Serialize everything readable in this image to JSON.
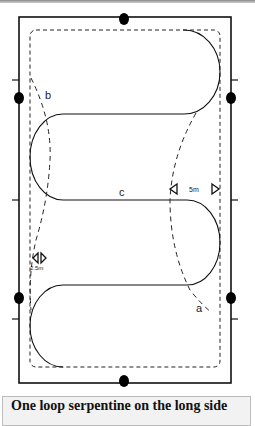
{
  "diagram": {
    "labels": {
      "a": "a",
      "b": "b",
      "c": "c",
      "distance_5m": "5m",
      "distance_2_5m": "2.5m"
    },
    "markers": {
      "cone_pair_right": "5m gate markers",
      "cone_pair_left": "2.5m gate markers"
    },
    "colors": {
      "line": "#111111",
      "dot": "#000000",
      "caption_bg": "#f2f2f2"
    }
  },
  "caption": {
    "text": "One loop serpentine on the long side"
  }
}
